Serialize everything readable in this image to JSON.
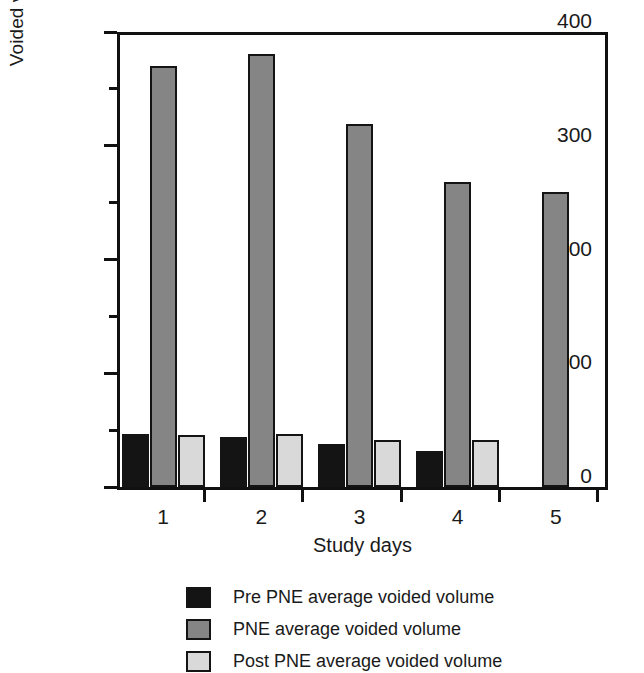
{
  "chart_data": {
    "type": "bar",
    "title": "",
    "xlabel": "Study days",
    "ylabel": "Voided volume (ml)",
    "categories": [
      "1",
      "2",
      "3",
      "4",
      "5"
    ],
    "series": [
      {
        "name": "Pre PNE average voided volume",
        "color": "#141414",
        "values": [
          47,
          44,
          38,
          32,
          null
        ]
      },
      {
        "name": "PNE average voided volume",
        "color": "#858585",
        "values": [
          370,
          381,
          319,
          268,
          259
        ]
      },
      {
        "name": "Post PNE average voided volume",
        "color": "#d9d9d9",
        "values": [
          46,
          47,
          41,
          41,
          null
        ]
      }
    ],
    "ylim": [
      0,
      400
    ],
    "ytick_labels": [
      "0",
      "100",
      "200",
      "300",
      "400"
    ],
    "ytick_values": [
      0,
      100,
      200,
      300,
      400
    ],
    "yminor_values": [
      50,
      150,
      250,
      350
    ],
    "grid": false,
    "legend_position": "bottom"
  },
  "axes": {
    "y_title": "Voided volume (ml)",
    "x_title": "Study days"
  },
  "legend": {
    "entries": [
      {
        "label": "Pre PNE average voided volume",
        "swatch": "pre"
      },
      {
        "label": "PNE average voided volume",
        "swatch": "pne"
      },
      {
        "label": "Post PNE average voided volume",
        "swatch": "post"
      }
    ]
  }
}
